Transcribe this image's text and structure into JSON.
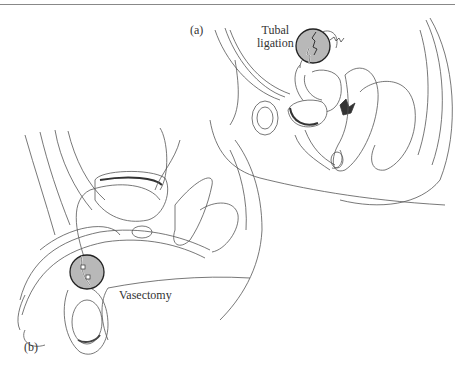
{
  "figure": {
    "panel_a": {
      "label": "(a)",
      "callout_line1": "Tubal",
      "callout_line2": "ligation"
    },
    "panel_b": {
      "label": "(b)",
      "callout": "Vasectomy"
    },
    "colors": {
      "line": "#555555",
      "highlight_fill": "#b8b8b8",
      "circle_stroke": "#222222",
      "shading": "#444444"
    }
  }
}
